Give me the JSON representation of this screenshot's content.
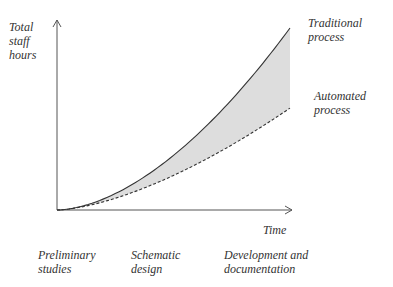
{
  "chart_data": {
    "type": "area",
    "title": "",
    "xlabel": "Time",
    "ylabel": "Total staff hours",
    "xlim": [
      0,
      1
    ],
    "ylim": [
      0,
      1
    ],
    "grid": false,
    "series": [
      {
        "name": "Traditional process",
        "style": "solid",
        "x": [
          0,
          0.25,
          0.5,
          0.75,
          1.0
        ],
        "y": [
          0,
          0.1,
          0.3,
          0.6,
          1.0
        ]
      },
      {
        "name": "Automated process",
        "style": "dashed",
        "x": [
          0,
          0.25,
          0.5,
          0.75,
          1.0
        ],
        "y": [
          0,
          0.06,
          0.19,
          0.37,
          0.56
        ]
      }
    ],
    "shaded_region": "between Traditional process and Automated process",
    "phase_labels": [
      "Preliminary\nstudies",
      "Schematic\ndesign",
      "Development and\ndocumentation"
    ],
    "colors": {
      "axis": "#555555",
      "line": "#333333",
      "fill": "#dddddd"
    }
  }
}
